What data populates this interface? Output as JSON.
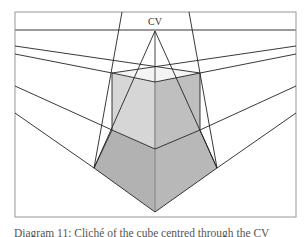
{
  "figure": {
    "label_cv": "CV",
    "caption": "Diagram 11: Cliché of the cube centred through the CV",
    "colors": {
      "frame": "#a8a8a8",
      "horizon": "#9a9a9a",
      "line": "#222222",
      "cube_left_face": "#d6d6d6",
      "cube_right_face": "#bfbfbf",
      "cube_top_face": "#f4f4f4",
      "lower_left_face": "#b2b2b2",
      "lower_right_face": "#b8b8b8",
      "center_line": "#999999"
    },
    "points": {
      "cv": [
        155,
        31
      ],
      "cube_top_left": [
        112,
        73
      ],
      "cube_top_right": [
        200,
        73
      ],
      "cube_top_front": [
        155,
        82
      ],
      "cube_top_back": [
        155,
        67
      ],
      "cube_bottom_left": [
        112,
        130
      ],
      "cube_bottom_right": [
        200,
        130
      ],
      "cube_bottom_front": [
        155,
        149
      ],
      "lower_left": [
        94,
        168
      ],
      "lower_right": [
        217,
        168
      ],
      "lower_bottom": [
        155,
        212
      ]
    }
  }
}
